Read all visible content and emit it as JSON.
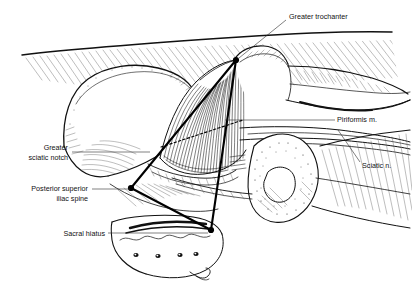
{
  "figure": {
    "background_color": "#ffffff",
    "ink_color": "#111111",
    "style": "black-and-white pen-and-ink anatomical line drawing with hatching and stippling"
  },
  "labels": [
    {
      "id": "greater-trochanter",
      "text": "Greater trochanter",
      "align": "left",
      "x": 289,
      "y": 17,
      "leader": "diagonal line running down-left from label to the greater trochanter of the femur"
    },
    {
      "id": "piriformis-muscle",
      "text": "Piriformis m.",
      "align": "left",
      "x": 337,
      "y": 119,
      "leader": "horizontal line running left from label into the striated piriformis muscle belly"
    },
    {
      "id": "sciatic-nerve",
      "text": "Sciatic n.",
      "align": "left",
      "x": 362,
      "y": 165,
      "leader": "short line running up-left from label to the sciatic nerve trunk"
    },
    {
      "id": "greater-sciatic-notch",
      "text": "Greater\nsciatic notch",
      "line1": "Greater",
      "line2": "sciatic notch",
      "align": "right",
      "x": 68,
      "y": 152,
      "leader": "horizontal line running right from label to the greater sciatic notch"
    },
    {
      "id": "posterior-superior-iliac-spine",
      "text": "Posterior superior\niliac spine",
      "line1": "Posterior superior",
      "line2": "iliac spine",
      "align": "right",
      "x": 88,
      "y": 192,
      "leader": "horizontal line running right from label to the posterior superior iliac spine vertex"
    },
    {
      "id": "sacral-hiatus",
      "text": "Sacral hiatus",
      "align": "right",
      "x": 105,
      "y": 236,
      "leader": "horizontal line running right from label to the sacral hiatus vertex"
    }
  ],
  "landmark_triangle": {
    "description": "Heavy black triangle connecting three palpable bony landmarks used for piriformis localization",
    "vertices": [
      {
        "name": "greater-trochanter-vertex",
        "x": 236,
        "y": 60
      },
      {
        "name": "posterior-superior-iliac-spine-vertex",
        "x": 131,
        "y": 188
      },
      {
        "name": "sacral-hiatus-vertex",
        "x": 211,
        "y": 230
      }
    ],
    "stroke_color": "#000000",
    "stroke_width": 2.1
  },
  "dashed_line": {
    "description": "Dashed reference line crossing the piriformis muscle belly",
    "from": {
      "x": 161,
      "y": 147
    },
    "to": {
      "x": 243,
      "y": 120
    }
  },
  "anatomy": [
    {
      "id": "skin-fascia-contour",
      "name": "Skin and fascial contour (upper border)"
    },
    {
      "id": "ilium",
      "name": "Ilium (iliac crest and gluteal surface)"
    },
    {
      "id": "greater-sciatic-notch-structure",
      "name": "Greater sciatic notch"
    },
    {
      "id": "piriformis-muscle-belly",
      "name": "Piriformis muscle"
    },
    {
      "id": "greater-trochanter-bone",
      "name": "Greater trochanter of femur"
    },
    {
      "id": "femur-shaft",
      "name": "Femur"
    },
    {
      "id": "sciatic-nerve-trunk",
      "name": "Sciatic nerve"
    },
    {
      "id": "sacrum",
      "name": "Sacrum with posterior sacral foramina"
    },
    {
      "id": "sacral-foramina",
      "name": "Posterior sacral foramina",
      "count": 4
    },
    {
      "id": "ischial-tuberosity",
      "name": "Ischial tuberosity"
    },
    {
      "id": "sacrotuberous-ligament",
      "name": "Sacrotuberous ligament"
    },
    {
      "id": "hamstring-origin",
      "name": "Hamstring origin / thigh musculature"
    }
  ]
}
